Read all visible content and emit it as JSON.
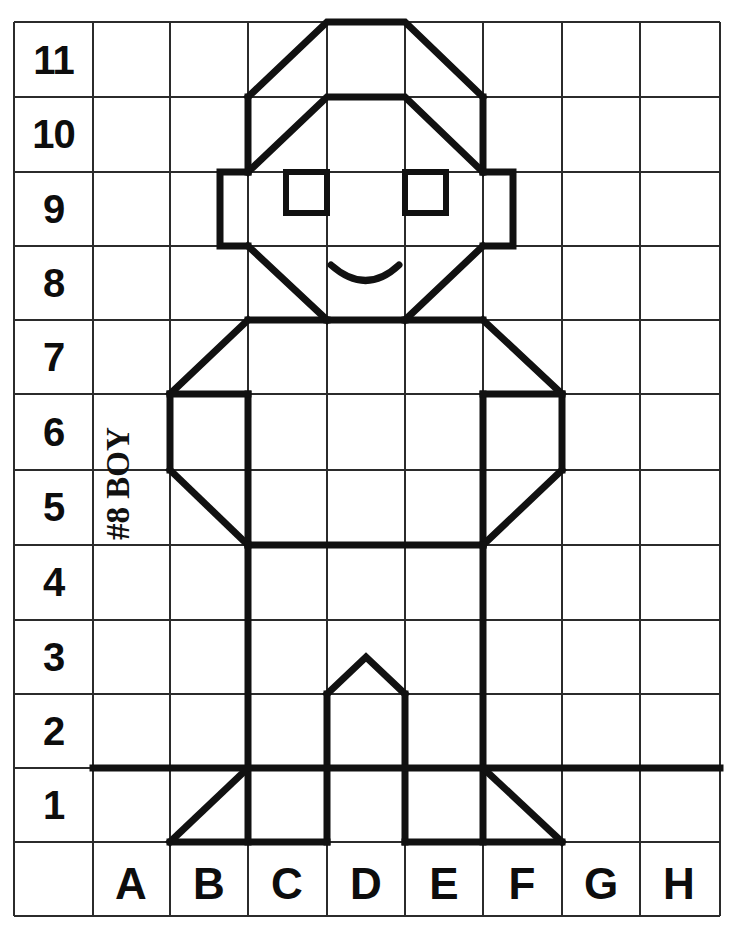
{
  "worksheet": {
    "title": "#8 BOY",
    "caption_label": "#8 BOY",
    "subject": "boy",
    "grid": {
      "columns": [
        "A",
        "B",
        "C",
        "D",
        "E",
        "F",
        "G",
        "H"
      ],
      "rows": [
        "11",
        "10",
        "9",
        "8",
        "7",
        "6",
        "5",
        "4",
        "3",
        "2",
        "1"
      ],
      "column_count": 8,
      "row_count": 11,
      "line_color": "#2b2b2b",
      "background_color": "#ffffff",
      "drawing_color": "#111111"
    },
    "row_labels": {
      "r11": "11",
      "r10": "10",
      "r9": "9",
      "r8": "8",
      "r7": "7",
      "r6": "6",
      "r5": "5",
      "r4": "4",
      "r3": "3",
      "r2": "2",
      "r1": "1"
    },
    "column_labels": {
      "cA": "A",
      "cB": "B",
      "cC": "C",
      "cD": "D",
      "cE": "E",
      "cF": "F",
      "cG": "G",
      "cH": "H"
    },
    "figure_parts": [
      "hair-outer",
      "hair-inner",
      "left-ear",
      "right-ear",
      "left-eye",
      "right-eye",
      "mouth-smile",
      "face-left-cheek",
      "face-right-cheek",
      "chin-line",
      "left-shoulder",
      "right-shoulder",
      "torso",
      "left-arm",
      "right-arm",
      "waist",
      "left-leg",
      "right-leg",
      "left-foot",
      "right-foot",
      "ground-line",
      "center-peak"
    ]
  }
}
